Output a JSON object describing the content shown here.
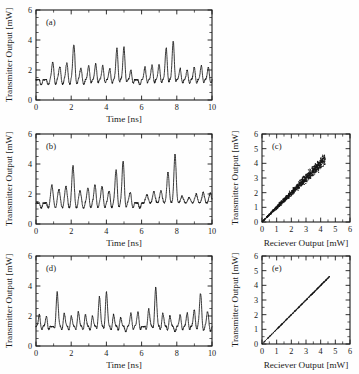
{
  "figure": {
    "background": "#fefefe",
    "ink": "#151515",
    "panel_count": 5
  },
  "chart_data": [
    {
      "id": "a",
      "panel_label": "(a)",
      "type": "line",
      "title": "",
      "xlabel": "Time [ns]",
      "ylabel": "Transmitter Output [mW]",
      "xlim": [
        0,
        10
      ],
      "ylim": [
        0,
        6
      ],
      "xticks": [
        0,
        2,
        4,
        6,
        8,
        10
      ],
      "yticks": [
        0,
        2,
        4,
        6
      ],
      "minor_x_per_major": 2,
      "minor_y_per_major": 4,
      "grid": false,
      "legend": "none",
      "units": {
        "x": "ns",
        "y": "mW"
      },
      "description": "Chaotic intensity time series of transmitter laser output",
      "baseline": 1.35,
      "oscillation_period_ns": 0.4,
      "peaks_ns": [
        0.95,
        1.35,
        1.75,
        2.15,
        2.55,
        3.0,
        3.4,
        3.8,
        4.2,
        4.6,
        5.0,
        5.4,
        6.2,
        6.6,
        7.0,
        7.4,
        7.8,
        8.2,
        8.6,
        9.0,
        9.4,
        9.8
      ],
      "peak_values": [
        2.5,
        2.2,
        2.45,
        3.7,
        2.1,
        2.3,
        2.45,
        2.3,
        2.1,
        3.45,
        3.55,
        2.0,
        2.2,
        2.35,
        2.4,
        3.5,
        3.95,
        2.1,
        2.0,
        2.2,
        2.3,
        2.2
      ],
      "min_value": 0.55,
      "max_value": 3.95
    },
    {
      "id": "b",
      "panel_label": "(b)",
      "type": "line",
      "title": "",
      "xlabel": "Time [ns]",
      "ylabel": "Transmitter Output [mW]",
      "xlim": [
        0,
        10
      ],
      "ylim": [
        0,
        6
      ],
      "xticks": [
        0,
        2,
        4,
        6,
        8,
        10
      ],
      "yticks": [
        0,
        2,
        4,
        6
      ],
      "minor_x_per_major": 2,
      "minor_y_per_major": 4,
      "grid": false,
      "legend": "none",
      "units": {
        "x": "ns",
        "y": "mW"
      },
      "description": "Chaotic intensity time series with larger spikes",
      "baseline": 1.4,
      "oscillation_period_ns": 0.4,
      "peaks_ns": [
        0.9,
        1.3,
        1.7,
        2.1,
        2.5,
        2.95,
        3.35,
        3.75,
        4.15,
        4.55,
        4.95,
        5.35,
        6.3,
        6.7,
        7.1,
        7.5,
        7.9,
        8.3,
        8.7,
        9.1,
        9.5,
        9.9
      ],
      "peak_values": [
        2.6,
        2.3,
        2.55,
        3.9,
        2.2,
        2.4,
        2.6,
        2.5,
        2.2,
        3.6,
        4.2,
        2.1,
        2.3,
        2.5,
        2.55,
        3.8,
        5.0,
        2.2,
        2.1,
        2.35,
        2.45,
        2.4
      ],
      "min_value": 0.5,
      "max_value": 5.0
    },
    {
      "id": "c",
      "panel_label": "(c)",
      "type": "scatter",
      "title": "",
      "xlabel": "Reciever Output [mW]",
      "ylabel": "Transmitter Output [mW]",
      "xlim": [
        0,
        6
      ],
      "ylim": [
        0,
        6
      ],
      "xticks": [
        0,
        1,
        2,
        3,
        4,
        5,
        6
      ],
      "yticks": [
        0,
        1,
        2,
        3,
        4,
        5,
        6
      ],
      "minor_x_per_major": 2,
      "minor_y_per_major": 2,
      "grid": false,
      "legend": "none",
      "units": {
        "x": "mW",
        "y": "mW"
      },
      "description": "Correlation plot of transmitter vs receiver output, imperfect synchronization showing a broadened diagonal cloud",
      "correlation_slope": 1.0,
      "cloud_extent": [
        0.0,
        4.3
      ],
      "spread_fraction": 0.13,
      "point_count": 900
    },
    {
      "id": "d",
      "panel_label": "(d)",
      "type": "line",
      "title": "",
      "xlabel": "Time [ns]",
      "ylabel": "Transmitter Output [mW]",
      "xlim": [
        0,
        10
      ],
      "ylim": [
        0,
        6
      ],
      "xticks": [
        0,
        2,
        4,
        6,
        8,
        10
      ],
      "yticks": [
        0,
        2,
        4,
        6
      ],
      "minor_x_per_major": 2,
      "minor_y_per_major": 4,
      "grid": false,
      "legend": "none",
      "units": {
        "x": "ns",
        "y": "mW"
      },
      "description": "Chaotic intensity time series, time-shifted relative to panels a and b",
      "baseline": 1.3,
      "oscillation_period_ns": 0.4,
      "peaks_ns": [
        0.2,
        0.6,
        1.2,
        1.6,
        2.0,
        2.4,
        2.8,
        3.2,
        3.6,
        4.0,
        4.4,
        4.8,
        5.4,
        5.8,
        6.4,
        6.8,
        7.2,
        7.6,
        8.2,
        8.6,
        9.0,
        9.35,
        9.75
      ],
      "peak_values": [
        2.1,
        2.0,
        3.6,
        2.2,
        2.0,
        2.3,
        2.1,
        2.0,
        3.3,
        3.6,
        2.1,
        1.9,
        2.2,
        2.3,
        2.5,
        3.9,
        2.2,
        2.0,
        2.1,
        2.2,
        2.4,
        3.5,
        2.3
      ],
      "min_value": 0.5,
      "max_value": 3.9
    },
    {
      "id": "e",
      "panel_label": "(e)",
      "type": "scatter",
      "title": "",
      "xlabel": "Reciever Output [mW]",
      "ylabel": "Transmitter Output [mW]",
      "xlim": [
        0,
        6
      ],
      "ylim": [
        0,
        6
      ],
      "xticks": [
        0,
        1,
        2,
        3,
        4,
        5,
        6
      ],
      "yticks": [
        0,
        1,
        2,
        3,
        4,
        5,
        6
      ],
      "minor_x_per_major": 2,
      "minor_y_per_major": 2,
      "grid": false,
      "legend": "none",
      "units": {
        "x": "mW",
        "y": "mW"
      },
      "description": "Correlation plot showing near-perfect chaos synchronization, a thin straight diagonal line",
      "correlation_slope": 1.0,
      "cloud_extent": [
        0.0,
        4.6
      ],
      "spread_fraction": 0.008,
      "point_count": 600
    }
  ]
}
